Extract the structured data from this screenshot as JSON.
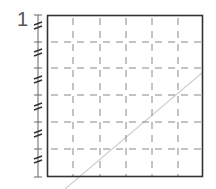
{
  "diagram": {
    "axis_label": "1",
    "grid": {
      "columns": 6,
      "rows": 6,
      "box": {
        "x": 47,
        "y": 15,
        "width": 156,
        "height": 162
      },
      "line_style": "dashed"
    },
    "axis": {
      "x": 38,
      "top": 15,
      "bottom": 177,
      "tick_count": 7,
      "break_marks": 6
    },
    "diagonal": {
      "x1": 65,
      "y1": 189,
      "x2": 203,
      "y2": 72
    },
    "colors": {
      "frame": "#333333",
      "grid": "#888888",
      "axis": "#666666",
      "diagonal": "#d0d0d0",
      "label": "#555555"
    }
  }
}
